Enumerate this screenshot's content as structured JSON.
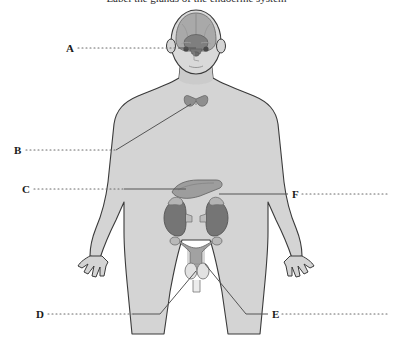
{
  "page": {
    "width": 393,
    "height": 348,
    "background_color": "#ffffff",
    "cut_off_heading": "Label the glands of the endocrine system"
  },
  "diagram": {
    "body_fill": "#d4d4d4",
    "body_stroke": "#3a3a3a",
    "organ_fill_light": "#b0b0b0",
    "organ_fill_mid": "#9a9a9a",
    "organ_fill_dark": "#7a7a7a",
    "leader_color": "#555555",
    "dot_color": "#6b6b6b",
    "organs": [
      {
        "name": "brain",
        "label_letter": "A"
      },
      {
        "name": "pituitary-hypothalamus",
        "label_letter": "A"
      },
      {
        "name": "thyroid",
        "label_letter": "B"
      },
      {
        "name": "pancreas",
        "label_letter": "C"
      },
      {
        "name": "ovaries-uterus",
        "label_letter": "D"
      },
      {
        "name": "testes",
        "label_letter": "E"
      },
      {
        "name": "adrenal-glands-kidneys",
        "label_letter": "F"
      }
    ]
  },
  "labels": [
    {
      "id": "A",
      "letter": "A",
      "x": 66,
      "y": 44,
      "side": "left",
      "target": "pituitary-gland",
      "dots_from": 78,
      "dots_to": 178,
      "leader_to_x": 196,
      "leader_to_y": 49
    },
    {
      "id": "B",
      "letter": "B",
      "x": 14,
      "y": 150,
      "side": "left",
      "target": "thyroid-gland",
      "dots_from": 26,
      "dots_to": 116,
      "leader_to_x": 191,
      "leader_to_y": 104
    },
    {
      "id": "C",
      "letter": "C",
      "x": 22,
      "y": 189,
      "side": "left",
      "target": "pancreas",
      "dots_from": 34,
      "dots_to": 124,
      "leader_to_x": 186,
      "leader_to_y": 189
    },
    {
      "id": "D",
      "letter": "D",
      "x": 36,
      "y": 315,
      "side": "left",
      "target": "ovaries",
      "dots_from": 48,
      "dots_to": 133,
      "leader_to_x": 196,
      "leader_to_y": 268
    },
    {
      "id": "E",
      "letter": "E",
      "x": 272,
      "y": 315,
      "side": "right",
      "target": "testes",
      "dots_from": 282,
      "dots_to": 388,
      "leader_to_x": 206,
      "leader_to_y": 258
    },
    {
      "id": "F",
      "letter": "F",
      "x": 292,
      "y": 194,
      "side": "right",
      "target": "adrenal-gland",
      "dots_from": 302,
      "dots_to": 390,
      "leader_to_x": 219,
      "leader_to_y": 194
    }
  ]
}
